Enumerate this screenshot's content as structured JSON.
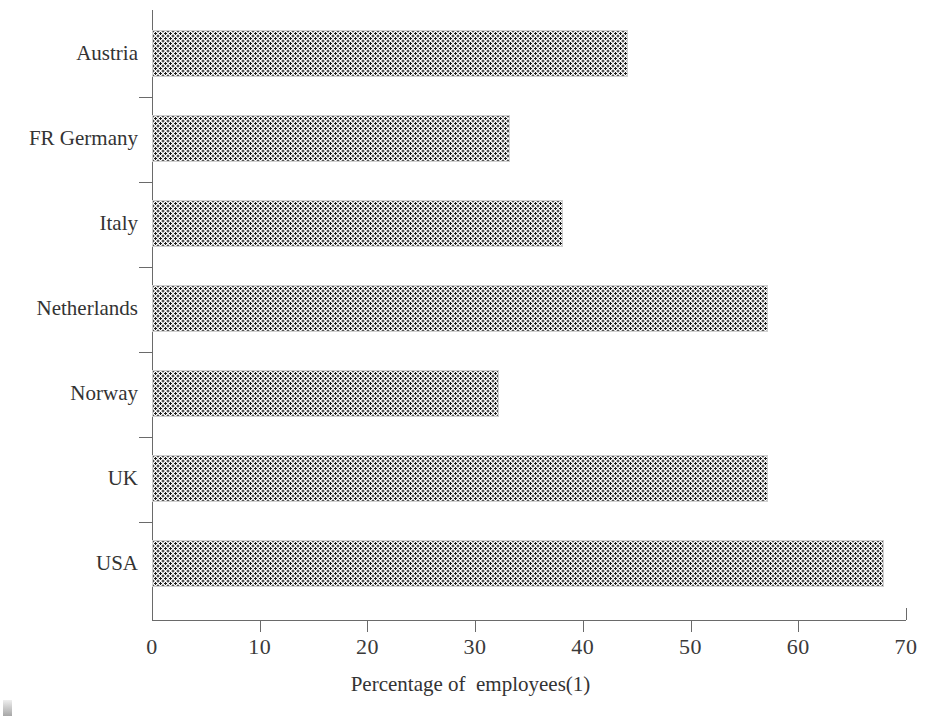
{
  "chart_data": {
    "type": "bar",
    "orientation": "horizontal",
    "title": "",
    "subtitle": "",
    "xlabel": "Percentage of  employees(1)",
    "ylabel": "",
    "categories": [
      "Austria",
      "FR Germany",
      "Italy",
      "Netherlands",
      "Norway",
      "UK",
      "USA"
    ],
    "values": [
      44.2,
      33.2,
      38.2,
      57.2,
      32.2,
      57.2,
      68.0
    ],
    "series": [
      {
        "name": "Percentage of employees",
        "values": [
          44.2,
          33.2,
          38.2,
          57.2,
          32.2,
          57.2,
          68.0
        ]
      }
    ],
    "xlim": [
      0,
      70
    ],
    "x_ticks": [
      0,
      10,
      20,
      30,
      40,
      50,
      60,
      70
    ],
    "x_tick_labels": [
      "0",
      "10",
      "20",
      "30",
      "40",
      "50",
      "60",
      "70"
    ],
    "grid": false,
    "legend": false,
    "legend_position": "none",
    "bar_fill": "dotted-pattern",
    "bar_fill_color": "#1a1a1a",
    "bar_background": "#ffffff",
    "axis_color": "#6a6a6a",
    "text_color": "#333333"
  },
  "axis": {
    "x_title": "Percentage of  employees(1)"
  },
  "artifacts": {
    "scan_mark": "scan-artifact"
  }
}
